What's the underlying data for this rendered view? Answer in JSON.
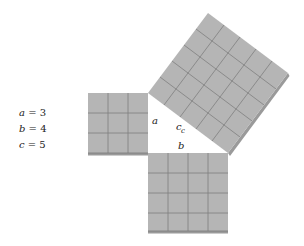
{
  "equations": [
    {
      "var": "a",
      "value": "3"
    },
    {
      "var": "b",
      "value": "4"
    },
    {
      "var": "c",
      "value": "5"
    }
  ],
  "labels": {
    "a": "a",
    "c": "c",
    "c_sub": "c",
    "b": "b"
  },
  "squares": [
    {
      "name": "square-a",
      "side": 3,
      "cells": 9
    },
    {
      "name": "square-b",
      "side": 4,
      "cells": 16
    },
    {
      "name": "square-c",
      "side": 5,
      "cells": 25
    }
  ],
  "colors": {
    "fill": "#b5b5b5",
    "grid": "#7f7f7f",
    "edge": "#8c8c8c",
    "background": "#ffffff"
  }
}
